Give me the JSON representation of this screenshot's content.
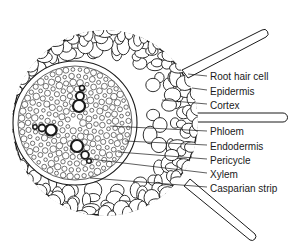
{
  "diagram": {
    "labels": [
      {
        "id": "root-hair-cell",
        "text": "Root hair cell",
        "x": 210,
        "y": 71
      },
      {
        "id": "epidermis",
        "text": "Epidermis",
        "x": 210,
        "y": 86
      },
      {
        "id": "cortex",
        "text": "Cortex",
        "x": 210,
        "y": 100
      },
      {
        "id": "phloem",
        "text": "Phloem",
        "x": 210,
        "y": 126
      },
      {
        "id": "endodermis",
        "text": "Endodermis",
        "x": 210,
        "y": 141
      },
      {
        "id": "pericycle",
        "text": "Pericycle",
        "x": 210,
        "y": 155
      },
      {
        "id": "xylem",
        "text": "Xylem",
        "x": 210,
        "y": 169
      },
      {
        "id": "casparian-strip",
        "text": "Casparian strip",
        "x": 210,
        "y": 183
      }
    ],
    "colors": {
      "ink": "#1a1a1a",
      "background": "#ffffff"
    }
  }
}
